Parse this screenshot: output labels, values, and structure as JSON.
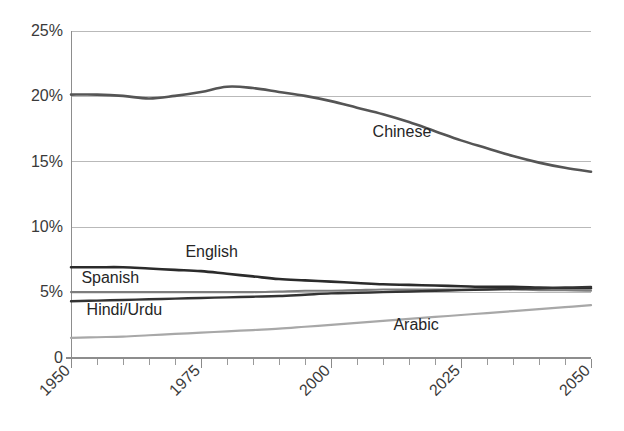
{
  "chart_data": {
    "type": "line",
    "title": "",
    "subtitle": "",
    "xlabel": "",
    "ylabel": "",
    "xlim": [
      1950,
      2050
    ],
    "ylim": [
      0,
      25
    ],
    "grid": true,
    "legend_position": "inline-labels",
    "y_ticks": [
      "0",
      "5%",
      "10%",
      "15%",
      "20%",
      "25%"
    ],
    "y_tick_values": [
      0,
      5,
      10,
      15,
      20,
      25
    ],
    "x_ticks": [
      "1950",
      "1975",
      "2000",
      "2025",
      "2050"
    ],
    "x_tick_values": [
      1950,
      1975,
      2000,
      2025,
      2050
    ],
    "x_minor_tick_step": 5,
    "x": [
      1950,
      1955,
      1960,
      1965,
      1970,
      1975,
      1980,
      1985,
      1990,
      1995,
      2000,
      2005,
      2010,
      2015,
      2020,
      2025,
      2030,
      2035,
      2040,
      2045,
      2050
    ],
    "series": [
      {
        "name": "Chinese",
        "color": "#555555",
        "width": 2.6,
        "label": "Chinese",
        "label_x": 2008,
        "label_y": 17.2,
        "values": [
          20.1,
          20.1,
          20.0,
          19.8,
          20.0,
          20.3,
          20.7,
          20.6,
          20.3,
          20.0,
          19.6,
          19.1,
          18.6,
          18.0,
          17.3,
          16.6,
          16.0,
          15.4,
          14.9,
          14.5,
          14.2
        ]
      },
      {
        "name": "English",
        "color": "#2b2b2b",
        "width": 2.6,
        "label": "English",
        "label_x": 1972,
        "label_y": 8.0,
        "values": [
          6.9,
          6.9,
          6.9,
          6.8,
          6.7,
          6.6,
          6.4,
          6.2,
          6.0,
          5.9,
          5.8,
          5.7,
          5.6,
          5.55,
          5.5,
          5.45,
          5.4,
          5.4,
          5.35,
          5.3,
          5.3
        ]
      },
      {
        "name": "Spanish",
        "color": "#7d7d7d",
        "width": 2.1,
        "label": "Spanish",
        "label_x": 1952,
        "label_y": 6.0,
        "values": [
          5.0,
          5.0,
          5.0,
          5.0,
          5.0,
          5.0,
          5.0,
          5.0,
          5.05,
          5.1,
          5.1,
          5.15,
          5.2,
          5.2,
          5.2,
          5.2,
          5.2,
          5.2,
          5.15,
          5.15,
          5.1
        ]
      },
      {
        "name": "Hindi/Urdu",
        "color": "#333333",
        "width": 2.4,
        "label": "Hindi/Urdu",
        "label_x": 1953,
        "label_y": 3.6,
        "values": [
          4.3,
          4.35,
          4.4,
          4.45,
          4.5,
          4.55,
          4.6,
          4.65,
          4.7,
          4.8,
          4.9,
          4.95,
          5.0,
          5.05,
          5.1,
          5.15,
          5.2,
          5.25,
          5.3,
          5.35,
          5.4
        ]
      },
      {
        "name": "Arabic",
        "color": "#a8a8a8",
        "width": 2.2,
        "label": "Arabic",
        "label_x": 2012,
        "label_y": 2.4,
        "values": [
          1.5,
          1.55,
          1.6,
          1.7,
          1.8,
          1.9,
          2.0,
          2.1,
          2.2,
          2.35,
          2.5,
          2.65,
          2.8,
          2.95,
          3.1,
          3.25,
          3.4,
          3.55,
          3.7,
          3.85,
          4.0
        ]
      }
    ]
  },
  "colors": {
    "background": "#ffffff",
    "gridline": "#b9b9b9",
    "axis": "#8d8d8d",
    "text": "#3a3a3a"
  }
}
